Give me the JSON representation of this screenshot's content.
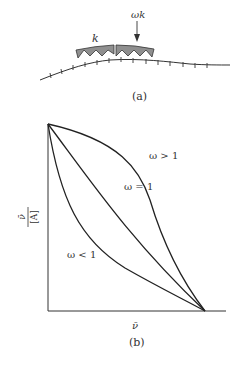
{
  "panel_a": {
    "caption": "(a)",
    "label_left": "k",
    "label_right": "ωk",
    "block_fill": "#8f8f8f",
    "line_color": "#333333"
  },
  "panel_b": {
    "caption": "(b)",
    "x_axis_label": "ν̄",
    "y_axis_label_num": "ν̄",
    "y_axis_label_den": "[A]",
    "curves": [
      {
        "label": "ω > 1",
        "shape": "convex"
      },
      {
        "label": "ω = 1",
        "shape": "linear"
      },
      {
        "label": "ω < 1",
        "shape": "concave"
      }
    ]
  }
}
